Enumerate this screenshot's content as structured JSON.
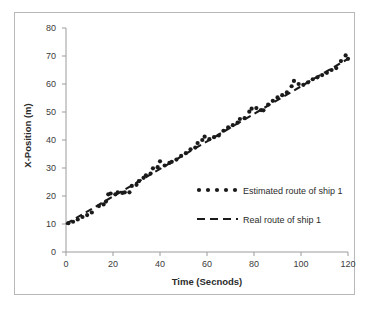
{
  "chart_data": {
    "type": "scatter",
    "title": "",
    "xlabel": "Time (Secnods)",
    "ylabel": "X-Position (m)",
    "xlim": [
      0,
      120
    ],
    "ylim": [
      0,
      80
    ],
    "xticks": [
      0,
      20,
      40,
      60,
      80,
      100,
      120
    ],
    "yticks": [
      0,
      10,
      20,
      30,
      40,
      50,
      60,
      70,
      80
    ],
    "grid": false,
    "legend_position": "inside-lower-right",
    "series": [
      {
        "name": "Estimated route of ship 1",
        "type": "scatter",
        "marker": "dot",
        "color": "#1a1a1a",
        "points": [
          [
            1,
            10.3
          ],
          [
            3,
            10.8
          ],
          [
            5,
            11.6
          ],
          [
            7,
            12.5
          ],
          [
            9,
            13.2
          ],
          [
            11,
            14.1
          ],
          [
            14,
            16.4
          ],
          [
            16,
            17.0
          ],
          [
            17,
            18.0
          ],
          [
            18,
            20.6
          ],
          [
            19,
            20.9
          ],
          [
            21,
            20.6
          ],
          [
            22,
            21.3
          ],
          [
            24,
            21.1
          ],
          [
            25,
            21.3
          ],
          [
            27,
            21.3
          ],
          [
            28,
            23.6
          ],
          [
            30,
            24.0
          ],
          [
            31,
            25.3
          ],
          [
            33,
            26.5
          ],
          [
            34,
            27.4
          ],
          [
            36,
            28.0
          ],
          [
            37,
            29.9
          ],
          [
            39,
            30.3
          ],
          [
            40,
            32.4
          ],
          [
            42,
            30.9
          ],
          [
            44,
            31.8
          ],
          [
            45,
            32.2
          ],
          [
            47,
            33.0
          ],
          [
            49,
            34.3
          ],
          [
            51,
            35.3
          ],
          [
            53,
            36.7
          ],
          [
            55,
            37.3
          ],
          [
            56,
            38.9
          ],
          [
            58,
            40.0
          ],
          [
            59,
            41.2
          ],
          [
            61,
            40.3
          ],
          [
            63,
            41.0
          ],
          [
            65,
            41.6
          ],
          [
            67,
            43.3
          ],
          [
            69,
            44.5
          ],
          [
            71,
            45.3
          ],
          [
            73,
            46.2
          ],
          [
            74,
            47.5
          ],
          [
            76,
            47.8
          ],
          [
            78,
            50.1
          ],
          [
            79,
            51.2
          ],
          [
            81,
            51.4
          ],
          [
            83,
            50.7
          ],
          [
            84,
            50.6
          ],
          [
            86,
            52.6
          ],
          [
            88,
            54.0
          ],
          [
            90,
            55.2
          ],
          [
            92,
            56.0
          ],
          [
            94,
            57.0
          ],
          [
            96,
            59.2
          ],
          [
            97,
            61.1
          ],
          [
            99,
            60.0
          ],
          [
            101,
            59.7
          ],
          [
            103,
            60.6
          ],
          [
            105,
            61.7
          ],
          [
            107,
            62.4
          ],
          [
            109,
            63.2
          ],
          [
            111,
            64.0
          ],
          [
            113,
            65.0
          ],
          [
            115,
            65.7
          ],
          [
            117,
            68.2
          ],
          [
            119,
            70.2
          ],
          [
            120,
            69.0
          ]
        ]
      },
      {
        "name": "Real route of ship 1",
        "type": "line",
        "style": "dashed",
        "color": "#1a1a1a",
        "points": [
          [
            0,
            10.0
          ],
          [
            120,
            69.0
          ]
        ]
      }
    ]
  },
  "legend": {
    "estimated_label": "Estimated route of ship 1",
    "real_label": "Real route of ship 1"
  },
  "axes": {
    "x_title": "Time (Secnods)",
    "y_title": "X-Position (m)",
    "x_tick_labels": [
      "0",
      "20",
      "40",
      "60",
      "80",
      "100",
      "120"
    ],
    "y_tick_labels": [
      "0",
      "10",
      "20",
      "30",
      "40",
      "50",
      "60",
      "70",
      "80"
    ]
  },
  "colors": {
    "series": "#1a1a1a",
    "axis": "#9b9b9b",
    "text": "#2b2b2b",
    "frame": "#b8b8b8"
  }
}
